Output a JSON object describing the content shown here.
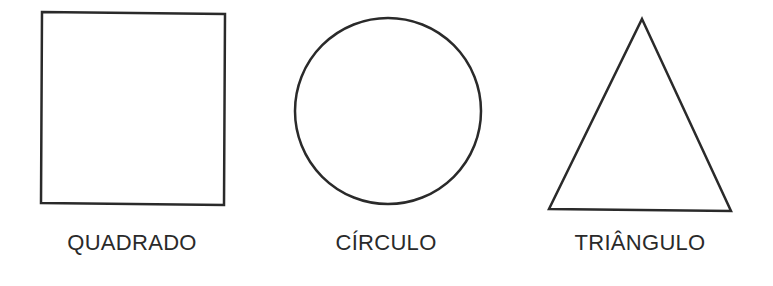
{
  "shapes": [
    {
      "name": "square",
      "label": "QUADRADO"
    },
    {
      "name": "circle",
      "label": "CÍRCULO"
    },
    {
      "name": "triangle",
      "label": "TRIÂNGULO"
    }
  ],
  "colors": {
    "stroke": "#2a2a2a",
    "background": "#ffffff"
  }
}
